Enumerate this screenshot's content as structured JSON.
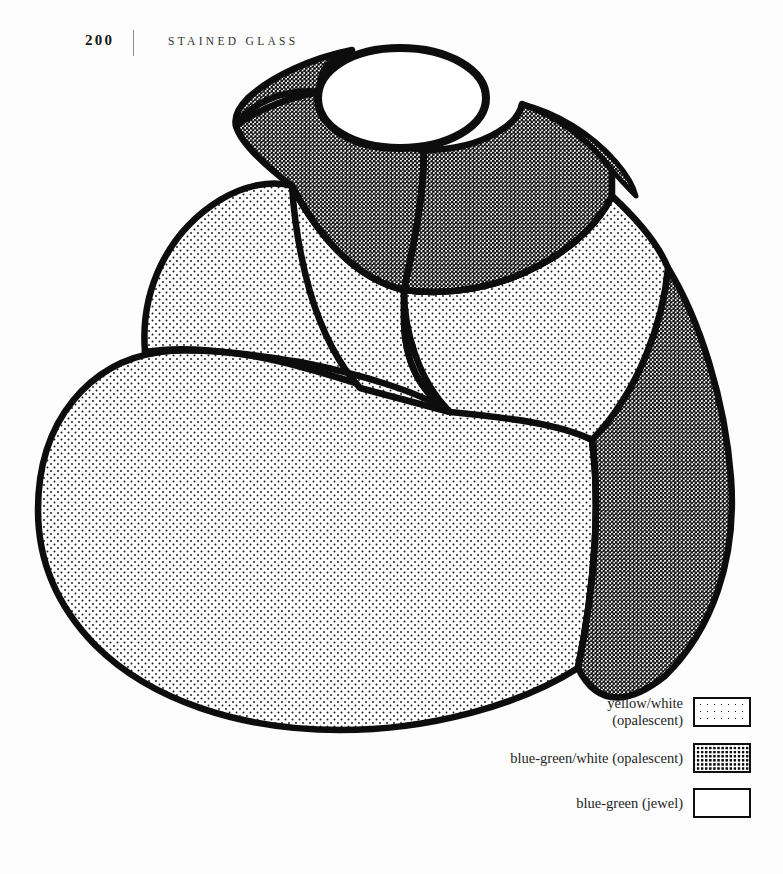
{
  "page": {
    "folio": "200",
    "running_title": "STAINED GLASS",
    "background_color": "#fdfdfd",
    "ink_color": "#0d0d0d"
  },
  "illustration": {
    "name": "tiered-stained-glass-lampshade",
    "description": "Line drawing of a three-tier domed stained glass lamp shade seen from above at an angle, with an open circular aperture at the crown and leaded seams dividing the glass panels.",
    "stroke_color": "#0d0d0d",
    "regions": [
      {
        "id": "crown-aperture",
        "material": "blue-green (jewel)",
        "fill": "plain"
      },
      {
        "id": "neck-band-left",
        "material": "blue-green/white (opalescent)",
        "fill": "dark-dot"
      },
      {
        "id": "neck-band-right",
        "material": "blue-green/white (opalescent)",
        "fill": "dark-dot"
      },
      {
        "id": "shoulder-left",
        "material": "yellow/white (opalescent)",
        "fill": "light-dot"
      },
      {
        "id": "shoulder-center",
        "material": "yellow/white (opalescent)",
        "fill": "light-dot"
      },
      {
        "id": "shoulder-right",
        "material": "yellow/white (opalescent)",
        "fill": "light-dot"
      },
      {
        "id": "body-main",
        "material": "yellow/white (opalescent)",
        "fill": "light-dot"
      },
      {
        "id": "body-right-crescent",
        "material": "blue-green/white (opalescent)",
        "fill": "dark-dot"
      }
    ]
  },
  "legend": {
    "title": "",
    "items": [
      {
        "label": "yellow/white\n(opalescent)",
        "swatch": "light-dot"
      },
      {
        "label": "blue-green/white (opalescent)",
        "swatch": "dark-dot"
      },
      {
        "label": "blue-green (jewel)",
        "swatch": "plain"
      }
    ]
  }
}
